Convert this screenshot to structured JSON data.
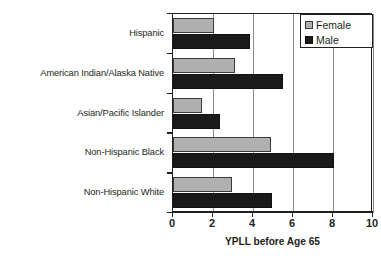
{
  "chart_data": {
    "type": "bar",
    "orientation": "horizontal",
    "title": "",
    "xlabel": "YPLL before Age 65",
    "ylabel": "",
    "xlim": [
      0,
      10
    ],
    "xticks": [
      0,
      2,
      4,
      6,
      8,
      10
    ],
    "xtick_labels": [
      "0",
      "2",
      "4",
      "6",
      "8",
      "10"
    ],
    "grid": "vertical",
    "legend_position": "top-right",
    "categories": [
      "Hispanic",
      "American Indian/Alaska Native",
      "Asian/Pacific Islander",
      "Non-Hispanic Black",
      "Non-Hispanic White"
    ],
    "series": [
      {
        "name": "Female",
        "color": "#b0b0b0",
        "values": [
          2.05,
          3.1,
          1.45,
          4.9,
          2.95
        ]
      },
      {
        "name": "Male",
        "color": "#1a1a1a",
        "values": [
          3.85,
          5.5,
          2.35,
          8.05,
          4.95
        ]
      }
    ]
  },
  "legend": {
    "entries": [
      {
        "label": "Female",
        "swatch": "female-swatch-icon"
      },
      {
        "label": "Male",
        "swatch": "male-swatch-icon"
      }
    ]
  }
}
